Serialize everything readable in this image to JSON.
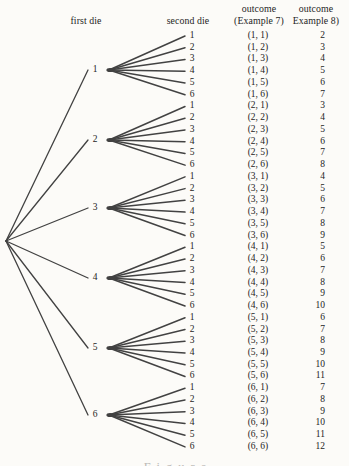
{
  "colors": {
    "ink": "#242424",
    "branch": "#424242",
    "paper": "#fcfbf8"
  },
  "headers": {
    "first_die": "first die",
    "second_die": "second die",
    "outcome_example7": {
      "line1": "outcome",
      "line2": "(Example 7)"
    },
    "outcome_example8": {
      "line1": "outcome",
      "line2": "Example 8)"
    }
  },
  "caption_fragment": "Figure",
  "tree": {
    "groups": [
      {
        "first_die": "1",
        "branches": [
          {
            "second_die": "1",
            "outcome": "(1, 1)",
            "sum": "2"
          },
          {
            "second_die": "2",
            "outcome": "(1, 2)",
            "sum": "3"
          },
          {
            "second_die": "3",
            "outcome": "(1, 3)",
            "sum": "4"
          },
          {
            "second_die": "4",
            "outcome": "(1, 4)",
            "sum": "5"
          },
          {
            "second_die": "5",
            "outcome": "(1, 5)",
            "sum": "6"
          },
          {
            "second_die": "6",
            "outcome": "(1, 6)",
            "sum": "7"
          }
        ]
      },
      {
        "first_die": "2",
        "branches": [
          {
            "second_die": "1",
            "outcome": "(2, 1)",
            "sum": "3"
          },
          {
            "second_die": "2",
            "outcome": "(2, 2)",
            "sum": "4"
          },
          {
            "second_die": "3",
            "outcome": "(2, 3)",
            "sum": "5"
          },
          {
            "second_die": "4",
            "outcome": "(2, 4)",
            "sum": "6"
          },
          {
            "second_die": "5",
            "outcome": "(2, 5)",
            "sum": "7"
          },
          {
            "second_die": "6",
            "outcome": "(2, 6)",
            "sum": "8"
          }
        ]
      },
      {
        "first_die": "3",
        "branches": [
          {
            "second_die": "1",
            "outcome": "(3, 1)",
            "sum": "4"
          },
          {
            "second_die": "2",
            "outcome": "(3, 2)",
            "sum": "5"
          },
          {
            "second_die": "3",
            "outcome": "(3, 3)",
            "sum": "6"
          },
          {
            "second_die": "4",
            "outcome": "(3, 4)",
            "sum": "7"
          },
          {
            "second_die": "5",
            "outcome": "(3, 5)",
            "sum": "8"
          },
          {
            "second_die": "6",
            "outcome": "(3, 6)",
            "sum": "9"
          }
        ]
      },
      {
        "first_die": "4",
        "branches": [
          {
            "second_die": "1",
            "outcome": "(4, 1)",
            "sum": "5"
          },
          {
            "second_die": "2",
            "outcome": "(4, 2)",
            "sum": "6"
          },
          {
            "second_die": "3",
            "outcome": "(4, 3)",
            "sum": "7"
          },
          {
            "second_die": "4",
            "outcome": "(4, 4)",
            "sum": "8"
          },
          {
            "second_die": "5",
            "outcome": "(4, 5)",
            "sum": "9"
          },
          {
            "second_die": "6",
            "outcome": "(4, 6)",
            "sum": "10"
          }
        ]
      },
      {
        "first_die": "5",
        "branches": [
          {
            "second_die": "1",
            "outcome": "(5, 1)",
            "sum": "6"
          },
          {
            "second_die": "2",
            "outcome": "(5, 2)",
            "sum": "7"
          },
          {
            "second_die": "3",
            "outcome": "(5, 3)",
            "sum": "8"
          },
          {
            "second_die": "4",
            "outcome": "(5, 4)",
            "sum": "9"
          },
          {
            "second_die": "5",
            "outcome": "(5, 5)",
            "sum": "10"
          },
          {
            "second_die": "6",
            "outcome": "(5, 6)",
            "sum": "11"
          }
        ]
      },
      {
        "first_die": "6",
        "branches": [
          {
            "second_die": "1",
            "outcome": "(6, 1)",
            "sum": "7"
          },
          {
            "second_die": "2",
            "outcome": "(6, 2)",
            "sum": "8"
          },
          {
            "second_die": "3",
            "outcome": "(6, 3)",
            "sum": "9"
          },
          {
            "second_die": "4",
            "outcome": "(6, 4)",
            "sum": "10"
          },
          {
            "second_die": "5",
            "outcome": "(6, 5)",
            "sum": "11"
          },
          {
            "second_die": "6",
            "outcome": "(6, 6)",
            "sum": "12"
          }
        ]
      }
    ]
  }
}
